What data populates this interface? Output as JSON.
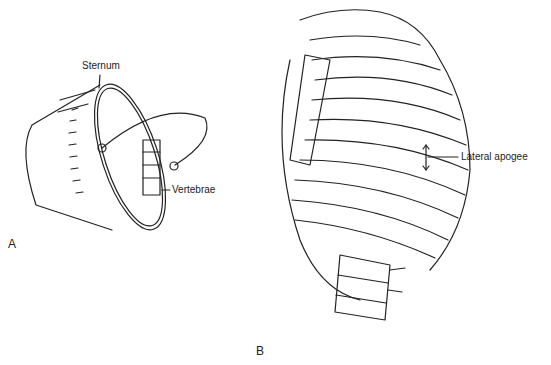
{
  "figure": {
    "panel_a": {
      "letter": "A",
      "subject": "bucket-handle model of rib motion",
      "labels": {
        "sternum": "Sternum",
        "vertebrae": "Vertebrae"
      }
    },
    "panel_b": {
      "letter": "B",
      "subject": "rib cage, anterolateral view",
      "labels": {
        "lateral_apogee": "Lateral apogee"
      }
    },
    "colors": {
      "line": "#222222",
      "background": "#ffffff"
    }
  }
}
